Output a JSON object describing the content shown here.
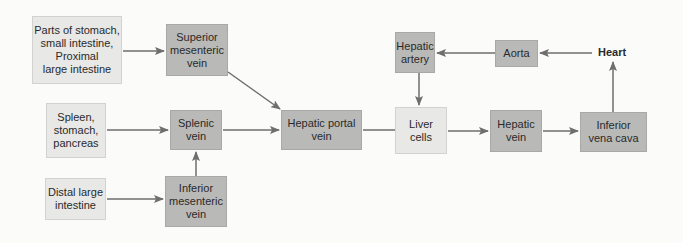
{
  "colors": {
    "source_box": "#e8e8e6",
    "vessel_box": "#b9b9b7",
    "liver_box": "#e8e8e6",
    "arrow": "#6e6e6e"
  },
  "nodes": {
    "parts_stomach": "Parts of stomach,\nsmall intestine,\nProximal\nlarge intestine",
    "spleen": "Spleen,\nstomach,\npancreas",
    "distal": "Distal large\nintestine",
    "sup_mes": "Superior\nmesenteric\nvein",
    "splenic": "Splenic\nvein",
    "inf_mes": "Inferior\nmesenteric\nvein",
    "portal": "Hepatic portal\nvein",
    "liver": "Liver\ncells",
    "hep_artery": "Hepatic\nartery",
    "aorta": "Aorta",
    "heart": "Heart",
    "hep_vein": "Hepatic\nvein",
    "ivc": "Inferior\nvena cava"
  },
  "edges": [
    [
      "parts_stomach",
      "sup_mes"
    ],
    [
      "spleen",
      "splenic"
    ],
    [
      "distal",
      "inf_mes"
    ],
    [
      "inf_mes",
      "splenic"
    ],
    [
      "sup_mes",
      "portal"
    ],
    [
      "splenic",
      "portal"
    ],
    [
      "portal",
      "liver"
    ],
    [
      "heart",
      "aorta"
    ],
    [
      "aorta",
      "hep_artery"
    ],
    [
      "hep_artery",
      "liver"
    ],
    [
      "liver",
      "hep_vein"
    ],
    [
      "hep_vein",
      "ivc"
    ],
    [
      "ivc",
      "heart"
    ]
  ]
}
